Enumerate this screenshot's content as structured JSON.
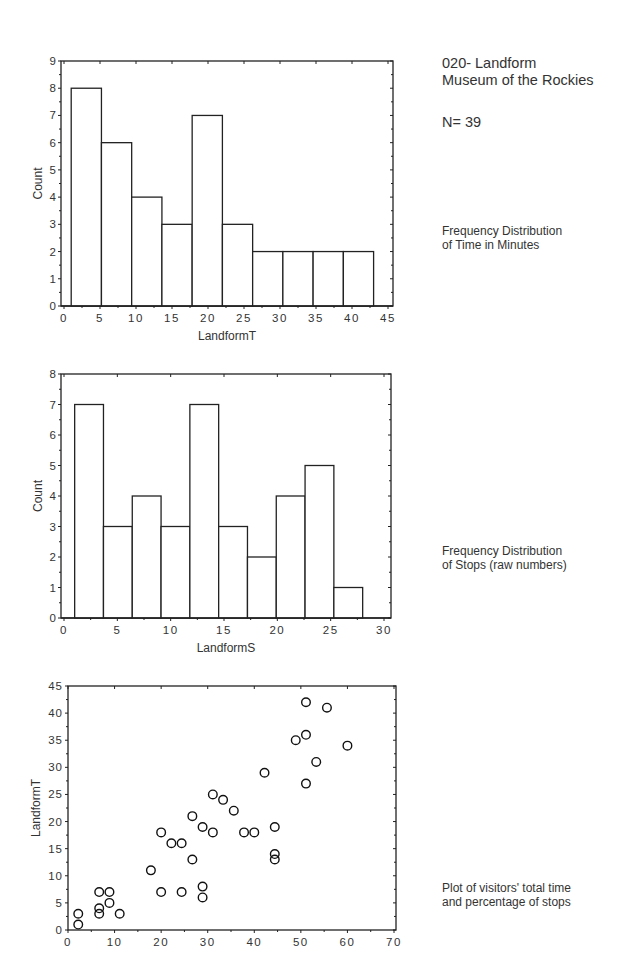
{
  "header": {
    "title_line1": "020- Landform",
    "title_line2": "Museum of the Rockies",
    "n_label": "N= 39"
  },
  "captions": {
    "chart1_line1": "Frequency Distribution",
    "chart1_line2": "of Time in Minutes",
    "chart2_line1": "Frequency Distribution",
    "chart2_line2": "of Stops (raw numbers)",
    "chart3_line1": "Plot of visitors' total time",
    "chart3_line2": "and percentage of stops"
  },
  "chart_data": [
    {
      "type": "bar",
      "title": "Frequency Distribution of Time in Minutes",
      "xlabel": "LandformT",
      "ylabel": "Count",
      "xlim": [
        0,
        45
      ],
      "ylim": [
        0,
        9
      ],
      "xticks": [
        0,
        5,
        10,
        15,
        20,
        25,
        30,
        35,
        40,
        45
      ],
      "yticks": [
        0,
        1,
        2,
        3,
        4,
        5,
        6,
        7,
        8,
        9
      ],
      "grid": false,
      "bins": [
        {
          "from": 1.0,
          "to": 5.2,
          "count": 8
        },
        {
          "from": 5.2,
          "to": 9.4,
          "count": 6
        },
        {
          "from": 9.4,
          "to": 13.6,
          "count": 4
        },
        {
          "from": 13.6,
          "to": 17.8,
          "count": 3
        },
        {
          "from": 17.8,
          "to": 22.0,
          "count": 7
        },
        {
          "from": 22.0,
          "to": 26.2,
          "count": 3
        },
        {
          "from": 26.2,
          "to": 30.4,
          "count": 2
        },
        {
          "from": 30.4,
          "to": 34.6,
          "count": 2
        },
        {
          "from": 34.6,
          "to": 38.8,
          "count": 2
        },
        {
          "from": 38.8,
          "to": 43.0,
          "count": 2
        }
      ]
    },
    {
      "type": "bar",
      "title": "Frequency Distribution of Stops (raw numbers)",
      "xlabel": "LandformS",
      "ylabel": "Count",
      "xlim": [
        0,
        30
      ],
      "ylim": [
        0,
        8
      ],
      "xticks": [
        0,
        5,
        10,
        15,
        20,
        25,
        30
      ],
      "yticks": [
        0,
        1,
        2,
        3,
        4,
        5,
        6,
        7,
        8
      ],
      "grid": false,
      "bins": [
        {
          "from": 1.0,
          "to": 3.7,
          "count": 7
        },
        {
          "from": 3.7,
          "to": 6.4,
          "count": 3
        },
        {
          "from": 6.4,
          "to": 9.1,
          "count": 4
        },
        {
          "from": 9.1,
          "to": 11.8,
          "count": 3
        },
        {
          "from": 11.8,
          "to": 14.5,
          "count": 7
        },
        {
          "from": 14.5,
          "to": 17.2,
          "count": 3
        },
        {
          "from": 17.2,
          "to": 19.9,
          "count": 2
        },
        {
          "from": 19.9,
          "to": 22.6,
          "count": 4
        },
        {
          "from": 22.6,
          "to": 25.3,
          "count": 5
        },
        {
          "from": 25.3,
          "to": 28.0,
          "count": 1
        }
      ]
    },
    {
      "type": "scatter",
      "title": "Plot of visitors' total time and percentage of stops",
      "xlabel": "",
      "ylabel": "LandformT",
      "xlim": [
        0,
        70
      ],
      "ylim": [
        0,
        45
      ],
      "xticks": [
        0,
        10,
        20,
        30,
        40,
        50,
        60,
        70
      ],
      "yticks": [
        0,
        5,
        10,
        15,
        20,
        25,
        30,
        35,
        40,
        45
      ],
      "grid": false,
      "marker": "open-circle",
      "points": [
        [
          2.2,
          1
        ],
        [
          2.2,
          3
        ],
        [
          6.7,
          3
        ],
        [
          6.7,
          4
        ],
        [
          6.7,
          7
        ],
        [
          8.9,
          5
        ],
        [
          8.9,
          7
        ],
        [
          11.1,
          3
        ],
        [
          17.8,
          11
        ],
        [
          20.0,
          7
        ],
        [
          20.0,
          18
        ],
        [
          22.2,
          16
        ],
        [
          24.4,
          16
        ],
        [
          24.4,
          7
        ],
        [
          26.7,
          21
        ],
        [
          26.7,
          13
        ],
        [
          28.9,
          19
        ],
        [
          28.9,
          8
        ],
        [
          28.9,
          6
        ],
        [
          31.1,
          25
        ],
        [
          31.1,
          18
        ],
        [
          33.3,
          24
        ],
        [
          35.6,
          22
        ],
        [
          37.8,
          18
        ],
        [
          40.0,
          18
        ],
        [
          42.2,
          29
        ],
        [
          44.4,
          19
        ],
        [
          44.4,
          14
        ],
        [
          44.4,
          13
        ],
        [
          48.9,
          35
        ],
        [
          51.1,
          42
        ],
        [
          51.1,
          36
        ],
        [
          51.1,
          27
        ],
        [
          53.3,
          31
        ],
        [
          55.6,
          41
        ],
        [
          60.0,
          34
        ]
      ]
    }
  ]
}
